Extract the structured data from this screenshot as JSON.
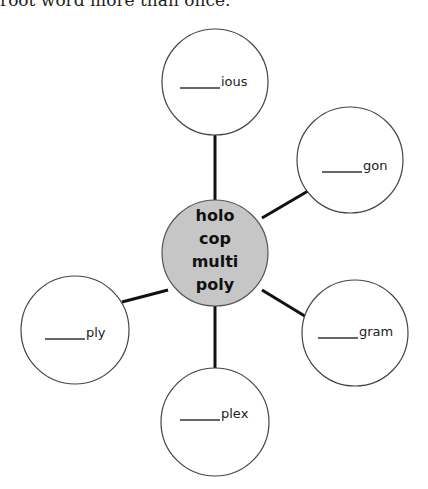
{
  "instruction": "root word more than once.",
  "center": {
    "words": [
      "holo",
      "cop",
      "multi",
      "poly"
    ],
    "fill": "#c6c6c6"
  },
  "nodes": [
    {
      "suffix": "ious",
      "blank": "______"
    },
    {
      "suffix": "gon",
      "blank": "______"
    },
    {
      "suffix": "gram",
      "blank": "______"
    },
    {
      "suffix": "plex",
      "blank": "______"
    },
    {
      "suffix": "ply",
      "blank": "______"
    }
  ]
}
